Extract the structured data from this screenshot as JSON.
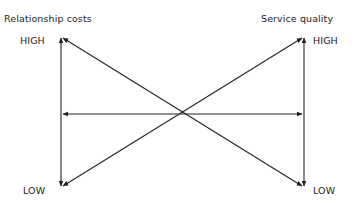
{
  "diagram": {
    "left_axis": {
      "title": "Relationship costs",
      "high_label": "HIGH",
      "low_label": "LOW"
    },
    "right_axis": {
      "title": "Service quality",
      "high_label": "HIGH",
      "low_label": "LOW"
    },
    "arrows": [
      {
        "name": "left-vertical-axis",
        "from": "LOW",
        "to": "HIGH",
        "bidirectional": true
      },
      {
        "name": "right-vertical-axis",
        "from": "LOW",
        "to": "HIGH",
        "bidirectional": true
      },
      {
        "name": "horizontal-connector",
        "from": "left",
        "to": "right",
        "bidirectional": true
      },
      {
        "name": "diagonal-costs-low-to-quality-high",
        "from": "Relationship costs LOW",
        "to": "Service quality HIGH",
        "bidirectional": true
      },
      {
        "name": "diagonal-costs-high-to-quality-low",
        "from": "Relationship costs HIGH",
        "to": "Service quality LOW",
        "bidirectional": true
      }
    ],
    "colors": {
      "line": "#222222",
      "text": "#222222",
      "background": "#ffffff"
    }
  }
}
